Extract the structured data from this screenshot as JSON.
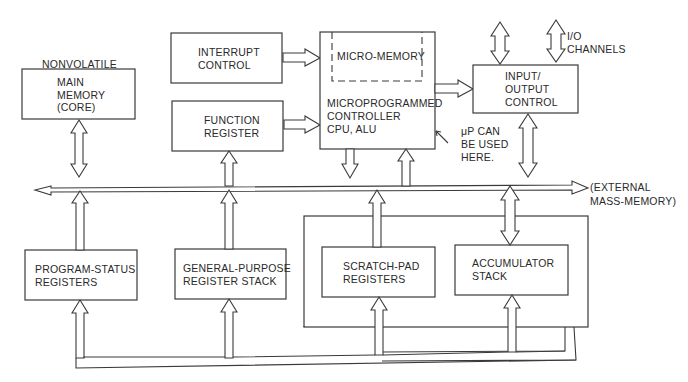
{
  "diagram": {
    "blocks": {
      "main_memory": {
        "caption": "NONVOLATILE",
        "line1": "MAIN",
        "line2": "MEMORY",
        "line3": "(CORE)"
      },
      "interrupt_control": {
        "line1": "INTERRUPT",
        "line2": "CONTROL"
      },
      "function_register": {
        "line1": "FUNCTION",
        "line2": "REGISTER"
      },
      "micro_memory": {
        "label": "MICRO-MEMORY"
      },
      "controller": {
        "line1": "MICROPROGRAMMED",
        "line2": "CONTROLLER",
        "line3": "CPU, ALU"
      },
      "io_control": {
        "line1": "INPUT/",
        "line2": "OUTPUT",
        "line3": "CONTROL"
      },
      "program_status": {
        "line1": "PROGRAM-STATUS",
        "line2": "REGISTERS"
      },
      "general_purpose": {
        "line1": "GENERAL-PURPOSE",
        "line2": "REGISTER STACK"
      },
      "scratch_pad": {
        "line1": "SCRATCH-PAD",
        "line2": "REGISTERS"
      },
      "accumulator": {
        "line1": "ACCUMULATOR",
        "line2": "STACK"
      }
    },
    "annotations": {
      "up_note": {
        "line1": "μP CAN",
        "line2": "BE USED",
        "line3": "HERE."
      },
      "io_channels": {
        "line1": "I/O",
        "line2": "CHANNELS"
      },
      "external": {
        "line1": "(EXTERNAL",
        "line2": "MASS-MEMORY)"
      }
    },
    "colors": {
      "stroke": "#3a3a3a",
      "text": "#2a2a2a",
      "background": "#ffffff"
    }
  }
}
